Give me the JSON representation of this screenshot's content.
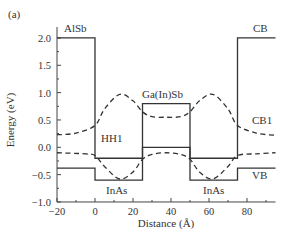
{
  "panel_label": "(a)",
  "chart_data": {
    "type": "line",
    "title": "",
    "xlabel": "Distance (Å)",
    "ylabel": "Energy (eV)",
    "xlim": [
      -20,
      95
    ],
    "ylim": [
      -1.0,
      2.2
    ],
    "xticks": [
      -20,
      0,
      20,
      40,
      60,
      80
    ],
    "yticks": [
      2.0,
      1.5,
      1.0,
      0.5,
      0.0,
      -0.5,
      -1.0
    ],
    "xtick_labels": [
      "−20",
      "0",
      "20",
      "40",
      "60",
      "80"
    ],
    "ytick_labels": [
      "2.0",
      "1.5",
      "1.0",
      "0.5",
      "0.0",
      "−0.5",
      "−1.0"
    ],
    "grid": false,
    "annotations": [
      "AlSb",
      "Ga(In)Sb",
      "InAs",
      "InAs",
      "CB",
      "CB1",
      "HH1",
      "VB"
    ],
    "series": [
      {
        "name": "CB",
        "style": "solid",
        "x": [
          -20,
          0,
          0,
          25,
          25,
          50,
          50,
          75,
          75,
          95
        ],
        "y": [
          2.0,
          2.0,
          -0.2,
          -0.2,
          0.8,
          0.8,
          -0.2,
          -0.2,
          2.0,
          2.0
        ]
      },
      {
        "name": "VB",
        "style": "solid",
        "x": [
          -20,
          0,
          0,
          25,
          25,
          50,
          50,
          75,
          75,
          95
        ],
        "y": [
          -0.38,
          -0.38,
          -0.6,
          -0.6,
          0.0,
          0.0,
          -0.6,
          -0.6,
          -0.38,
          -0.38
        ]
      },
      {
        "name": "CB1",
        "style": "dashed",
        "x": [
          -20,
          -10,
          0,
          5,
          13,
          20,
          25,
          30,
          37.5,
          45,
          50,
          55,
          62,
          70,
          75,
          85,
          95
        ],
        "y": [
          0.23,
          0.26,
          0.4,
          0.7,
          0.97,
          0.85,
          0.65,
          0.56,
          0.55,
          0.56,
          0.65,
          0.85,
          0.97,
          0.7,
          0.4,
          0.26,
          0.22
        ]
      },
      {
        "name": "HH1",
        "style": "dashed",
        "x": [
          -20,
          -5,
          0,
          5,
          13,
          20,
          25,
          30,
          37.5,
          45,
          50,
          55,
          62,
          70,
          75,
          85,
          95
        ],
        "y": [
          -0.1,
          -0.12,
          -0.15,
          -0.35,
          -0.58,
          -0.45,
          -0.22,
          -0.13,
          -0.1,
          -0.13,
          -0.22,
          -0.45,
          -0.58,
          -0.35,
          -0.15,
          -0.12,
          -0.1
        ]
      }
    ]
  },
  "labels": {
    "alsb": "AlSb",
    "gainsb": "Ga(In)Sb",
    "inas_left": "InAs",
    "inas_right": "InAs",
    "cb": "CB",
    "cb1": "CB1",
    "hh1": "HH1",
    "vb": "VB"
  }
}
